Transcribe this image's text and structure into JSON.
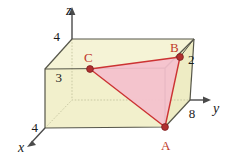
{
  "figure": {
    "background_color": "#ffffff",
    "box_fill_color": "#f2f0cc",
    "box_edge_color": "#4a4a3c",
    "triangle_fill_color": "#f4c0cd",
    "triangle_edge_color": "#cc3333",
    "point_color": "#b03030",
    "hidden_edge_color": "#c8c8a8"
  },
  "axes": [
    {
      "name": "z",
      "label": "z",
      "label_x": 66,
      "label_y": 15
    },
    {
      "name": "y",
      "label": "y",
      "label_x": 213,
      "label_y": 113
    },
    {
      "name": "x",
      "label": "x",
      "label_x": 18,
      "label_y": 152
    }
  ],
  "ticks": [
    {
      "name": "tick-z-4",
      "label": "4",
      "x": 60,
      "y": 41
    },
    {
      "name": "tick-z-3",
      "label": "3",
      "x": 62,
      "y": 82
    },
    {
      "name": "tick-x-4",
      "label": "4",
      "x": 32,
      "y": 132
    },
    {
      "name": "tick-y-8",
      "label": "8",
      "x": 192,
      "y": 118
    },
    {
      "name": "tick-b-2",
      "label": "2",
      "x": 188,
      "y": 64
    }
  ],
  "points": [
    {
      "name": "point-A",
      "label": "A",
      "cx": 165,
      "cy": 127,
      "label_x": 161,
      "label_y": 150
    },
    {
      "name": "point-B",
      "label": "B",
      "cx": 180,
      "cy": 57,
      "label_x": 170,
      "label_y": 52
    },
    {
      "name": "point-C",
      "label": "C",
      "cx": 90,
      "cy": 69,
      "label_x": 84,
      "label_y": 62
    }
  ],
  "geometry": {
    "box_vertices": {
      "front_bottom_left": "45,128",
      "front_bottom_right": "165,127",
      "front_top_left": "45,69",
      "front_top_right": "165,68",
      "back_bottom_left": "72,100",
      "back_bottom_right": "190,100",
      "back_top_left": "72,39",
      "back_top_right": "194,39"
    },
    "triangle_polygon": "165,127 180,57 90,69",
    "note": "Triangle ABC with A on the bottom front-right edge, B on the right rear vertical edge, C on the top-left back face"
  }
}
